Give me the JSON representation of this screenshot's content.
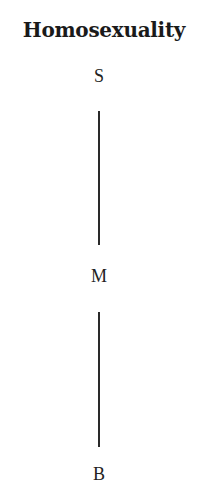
{
  "diagram": {
    "title": "Homosexuality",
    "nodes": [
      {
        "id": "S",
        "label": "S",
        "x": 99,
        "y": 66
      },
      {
        "id": "M",
        "label": "M",
        "x": 99,
        "y": 266
      },
      {
        "id": "B",
        "label": "B",
        "x": 99,
        "y": 464
      }
    ],
    "edges": [
      {
        "from": "S",
        "to": "M",
        "x": 99,
        "y1": 111,
        "y2": 245
      },
      {
        "from": "M",
        "to": "B",
        "x": 99,
        "y1": 312,
        "y2": 447
      }
    ],
    "colors": {
      "text": "#222222",
      "line": "#2a2a2a",
      "background": "#ffffff"
    }
  }
}
